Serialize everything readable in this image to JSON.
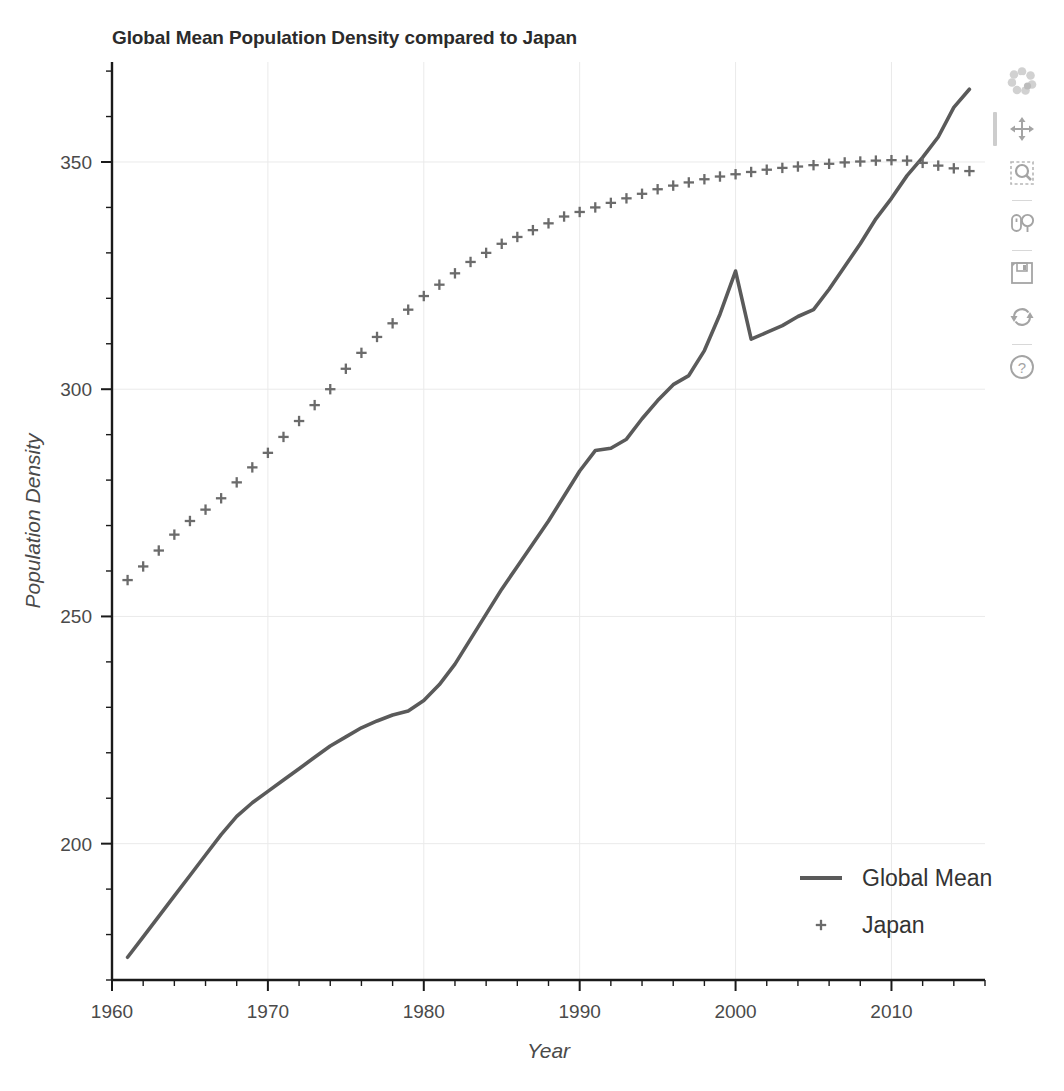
{
  "chart_data": {
    "type": "line",
    "title": "Global Mean Population Density compared to Japan",
    "xlabel": "Year",
    "ylabel": "Population Density",
    "xlim": [
      1960,
      2016
    ],
    "ylim": [
      170,
      372
    ],
    "xticks": [
      1960,
      1970,
      1980,
      1990,
      2000,
      2010
    ],
    "yticks": [
      200,
      250,
      300,
      350
    ],
    "x_minor_step": 2,
    "y_minor_step": 10,
    "grid": true,
    "legend_position": "bottom-right",
    "series": [
      {
        "name": "Global Mean",
        "style": "line",
        "color": "#5a5a5a",
        "x": [
          1961,
          1962,
          1963,
          1964,
          1965,
          1966,
          1967,
          1968,
          1969,
          1970,
          1971,
          1972,
          1973,
          1974,
          1975,
          1976,
          1977,
          1978,
          1979,
          1980,
          1981,
          1982,
          1983,
          1984,
          1985,
          1986,
          1987,
          1988,
          1989,
          1990,
          1991,
          1992,
          1993,
          1994,
          1995,
          1996,
          1997,
          1998,
          1999,
          2000,
          2001,
          2002,
          2003,
          2004,
          2005,
          2006,
          2007,
          2008,
          2009,
          2010,
          2011,
          2012,
          2013,
          2014,
          2015
        ],
        "values": [
          175.0,
          179.5,
          184.0,
          188.5,
          193.0,
          197.5,
          202.0,
          206.0,
          209.0,
          211.5,
          214.0,
          216.5,
          219.0,
          221.5,
          223.5,
          225.5,
          227.0,
          228.3,
          229.2,
          231.5,
          235.0,
          239.5,
          245.0,
          250.5,
          256.0,
          261.0,
          266.0,
          271.0,
          276.5,
          282.0,
          286.5,
          287.0,
          289.0,
          293.5,
          297.5,
          301.0,
          303.0,
          308.5,
          316.5,
          326.0,
          311.0,
          312.5,
          314.0,
          316.0,
          317.5,
          322.0,
          327.0,
          332.0,
          337.5,
          342.0,
          347.0,
          351.0,
          355.5,
          362.0,
          366.0
        ]
      },
      {
        "name": "Japan",
        "style": "markers",
        "marker": "+",
        "color": "#6b6b6b",
        "x": [
          1961,
          1962,
          1963,
          1964,
          1965,
          1966,
          1967,
          1968,
          1969,
          1970,
          1971,
          1972,
          1973,
          1974,
          1975,
          1976,
          1977,
          1978,
          1979,
          1980,
          1981,
          1982,
          1983,
          1984,
          1985,
          1986,
          1987,
          1988,
          1989,
          1990,
          1991,
          1992,
          1993,
          1994,
          1995,
          1996,
          1997,
          1998,
          1999,
          2000,
          2001,
          2002,
          2003,
          2004,
          2005,
          2006,
          2007,
          2008,
          2009,
          2010,
          2011,
          2012,
          2013,
          2014,
          2015
        ],
        "values": [
          258.0,
          261.0,
          264.5,
          268.0,
          271.0,
          273.5,
          276.0,
          279.5,
          282.8,
          286.0,
          289.5,
          293.0,
          296.5,
          300.0,
          304.5,
          308.0,
          311.5,
          314.5,
          317.5,
          320.5,
          323.0,
          325.5,
          328.0,
          330.0,
          332.0,
          333.5,
          335.0,
          336.5,
          338.0,
          339.0,
          340.0,
          341.0,
          342.0,
          343.0,
          344.0,
          344.8,
          345.5,
          346.2,
          346.8,
          347.3,
          347.8,
          348.3,
          348.7,
          349.0,
          349.3,
          349.6,
          349.9,
          350.1,
          350.3,
          350.4,
          350.3,
          349.8,
          349.2,
          348.6,
          348.0
        ]
      }
    ]
  },
  "legend": {
    "items": [
      {
        "label": "Global Mean",
        "glyph": "line"
      },
      {
        "label": "Japan",
        "glyph": "plus"
      }
    ]
  },
  "toolbar": {
    "tools": [
      {
        "name": "bokeh-logo",
        "label": "Bokeh",
        "active": false
      },
      {
        "name": "pan-tool",
        "label": "Pan",
        "active": true
      },
      {
        "name": "box-zoom-tool",
        "label": "Box Zoom",
        "active": false
      },
      {
        "name": "wheel-zoom-tool",
        "label": "Wheel Zoom",
        "active": false
      },
      {
        "name": "save-tool",
        "label": "Save",
        "active": false
      },
      {
        "name": "reset-tool",
        "label": "Reset",
        "active": false
      },
      {
        "name": "help-tool",
        "label": "Help",
        "active": false
      }
    ]
  },
  "colors": {
    "line": "#5a5a5a",
    "marker": "#6b6b6b",
    "axis": "#1a1a1a",
    "grid": "#eaeaea",
    "text": "#4a4a4a",
    "title": "#2b2b2b"
  }
}
